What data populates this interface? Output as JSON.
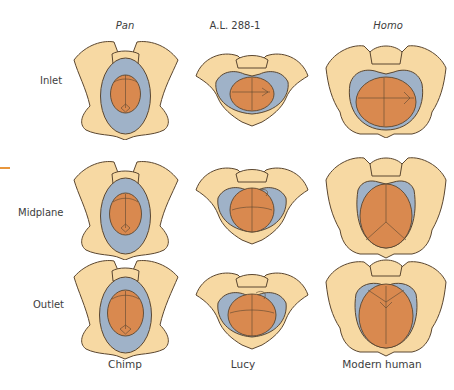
{
  "columns": [
    {
      "heading": "Pan",
      "heading_italic": true,
      "caption": "Chimp"
    },
    {
      "heading": "A.L. 288-1",
      "heading_italic": false,
      "caption": "Lucy"
    },
    {
      "heading": "Homo",
      "heading_italic": true,
      "caption": "Modern human"
    }
  ],
  "rows": [
    {
      "label": "Inlet"
    },
    {
      "label": "Midplane"
    },
    {
      "label": "Outlet"
    }
  ],
  "colors": {
    "bone": "#f7d9a3",
    "bone_outline": "#5a4630",
    "canal": "#9fb2c8",
    "fetal_head": "#d9894f",
    "accent_tick": "#e8963c"
  }
}
